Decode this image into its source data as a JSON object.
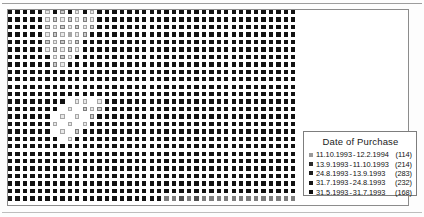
{
  "figure": {
    "kind": "dot-density-map",
    "background_color": "#ffffff",
    "frame_color": "#8c8c8c"
  },
  "legend": {
    "title": "Date of Purchase",
    "border_color": "#7d7d7d",
    "items": [
      {
        "from": "11.10.1993",
        "dash": "-",
        "to": "12.2.1994",
        "count": "(114)",
        "color": "#9a9a9a"
      },
      {
        "from": "13.9.1993",
        "dash": "-",
        "to": "11.10.1993",
        "count": "(214)",
        "color": "#2b2b2b"
      },
      {
        "from": "24.8.1993",
        "dash": "-",
        "to": "13.9.1993",
        "count": "(283)",
        "color": "#1d1d1d"
      },
      {
        "from": "31.7.1993",
        "dash": "-",
        "to": "24.8.1993",
        "count": "(232)",
        "color": "#161616"
      },
      {
        "from": "31.5.1993",
        "dash": "-",
        "to": "31.7.1993",
        "count": "(168)",
        "color": "#101010"
      }
    ]
  },
  "chart_data": {
    "type": "heatmap",
    "title": "Date of Purchase",
    "xlabel": "",
    "ylabel": "",
    "grid": false,
    "legend_position": "bottom-right",
    "cell_pitch_x": 7.45,
    "cell_pitch_y": 7.45,
    "cell_size": 4.4,
    "cols": 39,
    "rows": 26,
    "value_scale": "0 = white / empty, 1 = black / darkest",
    "palette": [
      "#ffffff",
      "#e8e8e8",
      "#c9c9c9",
      "#a6a6a6",
      "#7d7d7d",
      "#4f4f4f",
      "#2a2a2a",
      "#111111"
    ],
    "note": "Each matrix entry is the darkness of one small square in the map grid; blank/very light squares mark sparse regions in the upper-left and mid-left of the map.",
    "matrix": [
      [
        7,
        7,
        7,
        7,
        7,
        1,
        7,
        2,
        7,
        1,
        7,
        1,
        7,
        7,
        7,
        7,
        7,
        7,
        7,
        7,
        7,
        7,
        7,
        7,
        7,
        7,
        7,
        7,
        7,
        7,
        7,
        7,
        7,
        7,
        7,
        7,
        7,
        7,
        7
      ],
      [
        7,
        7,
        7,
        7,
        7,
        1,
        2,
        1,
        2,
        1,
        2,
        1,
        7,
        7,
        7,
        7,
        7,
        7,
        7,
        7,
        7,
        7,
        7,
        7,
        7,
        7,
        7,
        7,
        7,
        7,
        7,
        7,
        7,
        7,
        7,
        7,
        7,
        7,
        7
      ],
      [
        7,
        7,
        7,
        7,
        7,
        2,
        1,
        2,
        1,
        2,
        1,
        2,
        7,
        7,
        7,
        7,
        7,
        7,
        7,
        7,
        7,
        7,
        7,
        7,
        7,
        7,
        7,
        7,
        7,
        7,
        7,
        7,
        7,
        7,
        7,
        7,
        7,
        7,
        7
      ],
      [
        7,
        7,
        7,
        7,
        7,
        1,
        2,
        1,
        3,
        1,
        2,
        7,
        7,
        7,
        7,
        7,
        7,
        7,
        7,
        7,
        7,
        7,
        7,
        7,
        7,
        7,
        7,
        7,
        7,
        7,
        7,
        7,
        7,
        7,
        7,
        7,
        7,
        7,
        7
      ],
      [
        7,
        7,
        7,
        7,
        7,
        2,
        1,
        2,
        1,
        2,
        7,
        7,
        7,
        7,
        7,
        7,
        7,
        7,
        7,
        7,
        7,
        7,
        7,
        7,
        7,
        7,
        7,
        7,
        7,
        7,
        7,
        7,
        7,
        7,
        7,
        7,
        7,
        7,
        7
      ],
      [
        7,
        7,
        7,
        7,
        7,
        1,
        2,
        1,
        2,
        1,
        7,
        7,
        7,
        7,
        7,
        7,
        7,
        7,
        7,
        7,
        7,
        7,
        7,
        7,
        7,
        7,
        7,
        7,
        7,
        7,
        7,
        7,
        7,
        7,
        7,
        7,
        7,
        7,
        7
      ],
      [
        7,
        7,
        7,
        7,
        7,
        7,
        1,
        2,
        1,
        7,
        7,
        7,
        7,
        7,
        7,
        7,
        7,
        7,
        7,
        7,
        7,
        7,
        7,
        7,
        7,
        7,
        7,
        7,
        7,
        7,
        7,
        7,
        7,
        7,
        7,
        7,
        7,
        7,
        7
      ],
      [
        7,
        7,
        7,
        7,
        7,
        7,
        2,
        1,
        7,
        7,
        7,
        7,
        7,
        7,
        7,
        7,
        7,
        7,
        7,
        7,
        7,
        7,
        7,
        7,
        7,
        7,
        7,
        7,
        7,
        7,
        7,
        7,
        7,
        7,
        7,
        7,
        7,
        7,
        7
      ],
      [
        7,
        7,
        7,
        7,
        7,
        7,
        7,
        7,
        7,
        7,
        7,
        7,
        7,
        7,
        7,
        7,
        7,
        7,
        7,
        7,
        7,
        7,
        7,
        7,
        7,
        7,
        7,
        7,
        7,
        7,
        7,
        7,
        7,
        7,
        7,
        7,
        7,
        7,
        7
      ],
      [
        7,
        7,
        7,
        7,
        7,
        7,
        7,
        7,
        7,
        7,
        7,
        7,
        7,
        7,
        7,
        7,
        7,
        7,
        7,
        7,
        7,
        7,
        7,
        7,
        7,
        7,
        7,
        7,
        7,
        7,
        7,
        7,
        7,
        7,
        7,
        7,
        7,
        7,
        7
      ],
      [
        7,
        7,
        7,
        7,
        7,
        7,
        7,
        7,
        7,
        7,
        7,
        7,
        7,
        7,
        7,
        7,
        7,
        7,
        7,
        7,
        7,
        7,
        7,
        7,
        7,
        7,
        7,
        7,
        7,
        7,
        7,
        7,
        7,
        7,
        7,
        7,
        7,
        7,
        7
      ],
      [
        7,
        7,
        7,
        7,
        7,
        7,
        7,
        7,
        7,
        7,
        7,
        7,
        7,
        7,
        7,
        7,
        7,
        7,
        7,
        7,
        7,
        7,
        7,
        7,
        7,
        7,
        7,
        7,
        7,
        7,
        7,
        7,
        7,
        7,
        7,
        7,
        7,
        7,
        7
      ],
      [
        7,
        7,
        7,
        7,
        7,
        7,
        7,
        7,
        0,
        1,
        1,
        0,
        1,
        7,
        7,
        7,
        7,
        7,
        7,
        7,
        7,
        7,
        7,
        7,
        7,
        7,
        7,
        7,
        7,
        7,
        7,
        7,
        7,
        7,
        7,
        7,
        7,
        7,
        7
      ],
      [
        7,
        7,
        7,
        7,
        7,
        7,
        7,
        0,
        1,
        0,
        2,
        1,
        2,
        7,
        7,
        7,
        7,
        7,
        7,
        7,
        7,
        7,
        7,
        7,
        7,
        7,
        7,
        7,
        7,
        7,
        7,
        7,
        7,
        7,
        7,
        7,
        7,
        7,
        7
      ],
      [
        7,
        7,
        7,
        7,
        7,
        7,
        0,
        1,
        0,
        1,
        0,
        2,
        7,
        7,
        7,
        7,
        7,
        7,
        7,
        7,
        7,
        7,
        7,
        7,
        7,
        7,
        7,
        7,
        7,
        7,
        7,
        7,
        7,
        7,
        7,
        7,
        7,
        7,
        7
      ],
      [
        7,
        7,
        7,
        7,
        7,
        7,
        1,
        0,
        1,
        0,
        1,
        7,
        7,
        7,
        7,
        7,
        7,
        7,
        7,
        7,
        7,
        7,
        7,
        7,
        7,
        7,
        7,
        7,
        7,
        7,
        7,
        7,
        7,
        7,
        7,
        7,
        7,
        7,
        7
      ],
      [
        7,
        7,
        7,
        7,
        7,
        7,
        0,
        1,
        0,
        2,
        7,
        7,
        7,
        7,
        7,
        7,
        7,
        7,
        7,
        7,
        7,
        7,
        7,
        7,
        7,
        7,
        7,
        7,
        7,
        7,
        7,
        7,
        7,
        7,
        7,
        7,
        7,
        7,
        7
      ],
      [
        7,
        7,
        7,
        7,
        7,
        7,
        7,
        0,
        1,
        7,
        7,
        7,
        7,
        7,
        7,
        7,
        7,
        7,
        7,
        7,
        7,
        7,
        7,
        7,
        7,
        7,
        7,
        7,
        7,
        7,
        7,
        7,
        7,
        7,
        7,
        7,
        7,
        7,
        7
      ],
      [
        7,
        7,
        7,
        7,
        7,
        7,
        7,
        7,
        7,
        7,
        7,
        7,
        7,
        7,
        7,
        7,
        7,
        7,
        7,
        7,
        7,
        7,
        7,
        7,
        7,
        7,
        7,
        7,
        7,
        7,
        7,
        7,
        7,
        7,
        7,
        7,
        7,
        7,
        7
      ],
      [
        7,
        7,
        7,
        7,
        7,
        7,
        7,
        7,
        7,
        7,
        7,
        7,
        7,
        7,
        7,
        7,
        7,
        7,
        7,
        7,
        7,
        7,
        7,
        7,
        7,
        7,
        7,
        7,
        7,
        7,
        7,
        7,
        7,
        7,
        7,
        7,
        7,
        7,
        7
      ],
      [
        7,
        7,
        7,
        7,
        7,
        7,
        7,
        7,
        7,
        7,
        7,
        7,
        7,
        7,
        7,
        7,
        7,
        7,
        7,
        7,
        7,
        7,
        7,
        7,
        7,
        7,
        7,
        7,
        7,
        7,
        7,
        7,
        7,
        7,
        7,
        7,
        7,
        7,
        7
      ],
      [
        7,
        7,
        7,
        7,
        7,
        7,
        7,
        7,
        7,
        7,
        7,
        7,
        7,
        7,
        7,
        7,
        7,
        7,
        7,
        7,
        7,
        7,
        7,
        7,
        7,
        7,
        7,
        7,
        7,
        7,
        7,
        7,
        7,
        7,
        7,
        7,
        7,
        7,
        7
      ],
      [
        7,
        7,
        7,
        7,
        7,
        7,
        7,
        7,
        7,
        7,
        7,
        7,
        7,
        7,
        7,
        7,
        7,
        7,
        7,
        7,
        7,
        7,
        7,
        7,
        7,
        7,
        7,
        7,
        7,
        7,
        7,
        7,
        7,
        7,
        7,
        7,
        7,
        7,
        7
      ],
      [
        7,
        7,
        7,
        7,
        7,
        7,
        7,
        7,
        7,
        7,
        7,
        7,
        7,
        7,
        7,
        7,
        7,
        7,
        7,
        7,
        7,
        7,
        7,
        7,
        7,
        7,
        7,
        7,
        7,
        7,
        7,
        7,
        7,
        7,
        7,
        7,
        7,
        7,
        7
      ],
      [
        7,
        7,
        7,
        7,
        7,
        7,
        7,
        7,
        7,
        7,
        7,
        7,
        7,
        7,
        7,
        7,
        7,
        7,
        7,
        7,
        7,
        7,
        7,
        7,
        7,
        7,
        7,
        7,
        7,
        7,
        7,
        7,
        7,
        7,
        7,
        7,
        7,
        7,
        7
      ],
      [
        7,
        7,
        7,
        7,
        7,
        7,
        7,
        7,
        7,
        7,
        7,
        7,
        7,
        7,
        7,
        7,
        7,
        7,
        7,
        7,
        7,
        4,
        4,
        5,
        4,
        5,
        4,
        4,
        4,
        4,
        4,
        4,
        4,
        4,
        4,
        4,
        4,
        4,
        4
      ]
    ]
  }
}
